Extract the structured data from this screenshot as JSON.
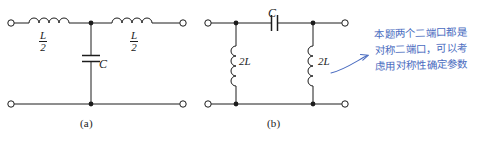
{
  "figure": {
    "line_color": "#1c1c1c",
    "annotation_color": "#4a6cc0"
  },
  "circuit_a": {
    "caption": "(a)",
    "type": "T-network",
    "components": [
      {
        "name": "series-inductor-left",
        "label_num": "L",
        "label_den": "2"
      },
      {
        "name": "shunt-capacitor",
        "label": "C"
      },
      {
        "name": "series-inductor-right",
        "label_num": "L",
        "label_den": "2"
      }
    ]
  },
  "circuit_b": {
    "caption": "(b)",
    "type": "Pi-network",
    "components": [
      {
        "name": "shunt-inductor-left",
        "label": "2L"
      },
      {
        "name": "series-capacitor",
        "label": "C"
      },
      {
        "name": "shunt-inductor-right",
        "label": "2L"
      }
    ]
  },
  "annotation": {
    "lines": [
      "本题两个二端口都是",
      "对称二端口，可以考",
      "虑用对称性确定参数"
    ]
  }
}
